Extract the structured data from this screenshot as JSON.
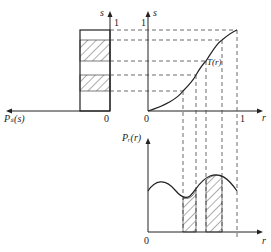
{
  "labels": {
    "left_xaxis": "Pₛ(s)",
    "left_s_axis": "s",
    "left_one": "1",
    "left_zero": "0",
    "mid_s_axis": "s",
    "mid_one": "1",
    "mid_zero": "0",
    "mid_r_one": "1",
    "mid_r_axis": "r",
    "curve_label": "T(r)",
    "bottom_yaxis": "Pᵣ(r)",
    "bottom_zero": "0",
    "bottom_r_axis": "r"
  },
  "colors": {
    "line": "#222222",
    "dash": "#444444"
  }
}
